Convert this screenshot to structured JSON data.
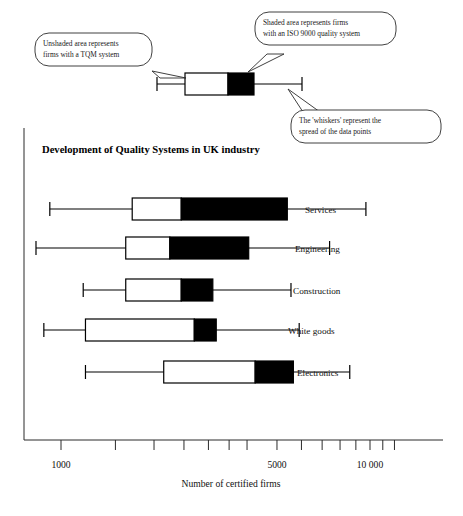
{
  "figure": {
    "title": "Development of Quality Systems in UK industry",
    "axis_title": "Number of certified firms"
  },
  "callouts": [
    {
      "name": "callout-unshaded",
      "line1": "Unshaded area represents",
      "line2": "firms with a TQM system"
    },
    {
      "name": "callout-shaded",
      "line1": "Shaded area represents firms",
      "line2": "with an ISO 9000 quality system"
    },
    {
      "name": "callout-whiskers",
      "line1": "The  'whiskers' represent the",
      "line2": "spread of the data points"
    }
  ],
  "legend_box": {
    "name": "example-box-plot",
    "whisker_low": 1150,
    "q1": 2050,
    "split": 3500,
    "q3": 4700,
    "whisker_high": 7900
  },
  "chart_data": {
    "type": "bar",
    "subtype": "box-plot-horizontal",
    "title": "Development of Quality Systems in UK industry",
    "xlabel": "Number of certified firms",
    "ylabel": "",
    "xscale": "log",
    "xlim": [
      800,
      14000
    ],
    "grid": false,
    "legend": [
      "Unshaded area represents firms with a TQM system",
      "Shaded area represents firms with an ISO 9000 quality system",
      "The 'whiskers' represent the spread of the data points"
    ],
    "tick_values": [
      1000,
      5000,
      10000
    ],
    "tick_labels": [
      "1000",
      "5000",
      "10 000"
    ],
    "minor_ticks": [
      1500,
      2000,
      2500,
      3000,
      3500,
      4000,
      6000,
      7000,
      8000,
      9000,
      11000,
      12000
    ],
    "categories": [
      "Services",
      "Engineering",
      "Construction",
      "White goods",
      "Electronics"
    ],
    "series": [
      {
        "name": "Services",
        "whisker_low": 920,
        "q1": 1700,
        "split": 2450,
        "q3": 5400,
        "whisker_high": 9700
      },
      {
        "name": "Engineering",
        "whisker_low": 830,
        "q1": 1620,
        "split": 2250,
        "q3": 4050,
        "whisker_high": 7400
      },
      {
        "name": "Construction",
        "whisker_low": 1180,
        "q1": 1620,
        "split": 2450,
        "q3": 3100,
        "whisker_high": 5550
      },
      {
        "name": "White goods",
        "whisker_low": 880,
        "q1": 1200,
        "split": 2700,
        "q3": 3180,
        "whisker_high": 5900
      },
      {
        "name": "Electronics",
        "whisker_low": 1200,
        "q1": 2150,
        "split": 4250,
        "q3": 5650,
        "whisker_high": 8600
      }
    ]
  }
}
